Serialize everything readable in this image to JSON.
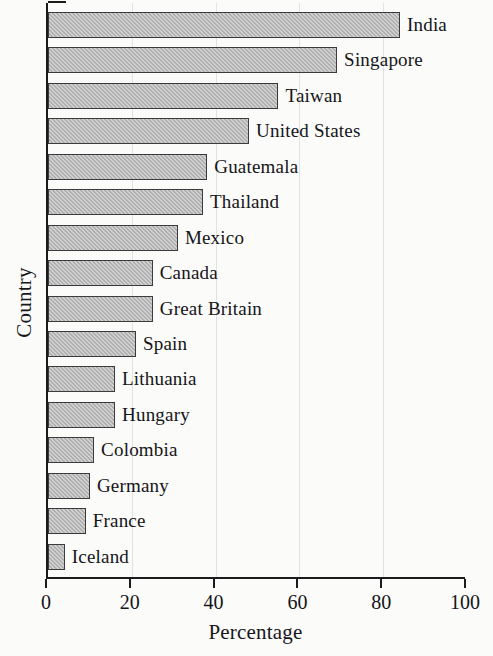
{
  "chart_data": {
    "type": "bar",
    "orientation": "horizontal",
    "title": "",
    "xlabel": "Percentage",
    "ylabel": "Country",
    "xlim": [
      0,
      100
    ],
    "xticks": [
      0,
      20,
      40,
      60,
      80,
      100
    ],
    "grid": true,
    "legend": null,
    "bar_label_position": "outside-right",
    "categories": [
      "India",
      "Singapore",
      "Taiwan",
      "United States",
      "Guatemala",
      "Thailand",
      "Mexico",
      "Canada",
      "Great Britain",
      "Spain",
      "Lithuania",
      "Hungary",
      "Colombia",
      "Germany",
      "France",
      "Iceland"
    ],
    "values": [
      84,
      69,
      55,
      48,
      38,
      37,
      31,
      25,
      25,
      21,
      16,
      16,
      11,
      10,
      9,
      4
    ],
    "series": [
      {
        "name": "Percentage",
        "values": [
          84,
          69,
          55,
          48,
          38,
          37,
          31,
          25,
          25,
          21,
          16,
          16,
          11,
          10,
          9,
          4
        ]
      }
    ],
    "colors": {
      "bar_fill": "#adadad",
      "bar_edge": "#3b3a3c",
      "axis": "#1b1a1d",
      "grid": "#e3e2e0",
      "background": "#fbfbfa",
      "text": "#151417"
    }
  }
}
